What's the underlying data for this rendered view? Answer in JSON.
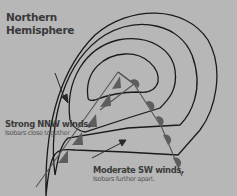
{
  "diagram": {
    "title_line1": "Northern",
    "title_line2": "Hemisphere",
    "background_color": "#b7b7b7",
    "isobar_color": "#1a1a1a",
    "front_color": "#5a5a5a",
    "labels": {
      "strong": {
        "main": "Strong NNW winds,",
        "sub": "Isobars close together"
      },
      "moderate": {
        "main": "Moderate SW winds,",
        "sub": "Isobars further apart."
      }
    },
    "elements": {
      "isobars": 4,
      "cold_front": "triangles",
      "warm_front": "semicircles",
      "arrows": [
        "strong-nnw-wind-arrow",
        "moderate-sw-wind-arrow"
      ]
    }
  }
}
